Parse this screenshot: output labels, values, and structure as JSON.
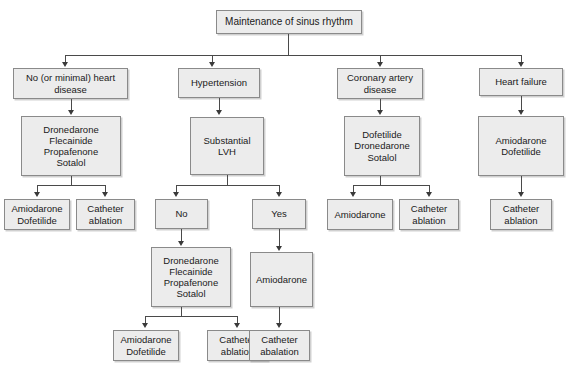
{
  "diagram": {
    "title": "Maintenance of sinus rhythm",
    "type": "flowchart",
    "nodes": {
      "root": "Maintenance of sinus rhythm",
      "branch_no_heart_disease": "No (or minimal) heart\ndisease",
      "branch_hypertension": "Hypertension",
      "branch_coronary": "Coronary artery\ndisease",
      "branch_heart_failure": "Heart failure",
      "nhd_drugs": "Dronedarone\nFlecainide\nPropafenone\nSotalol",
      "nhd_amio": "Amiodarone\nDofetilide",
      "nhd_ablation": "Catheter\nablation",
      "htn_lvh": "Substantial\nLVH",
      "htn_no": "No",
      "htn_yes": "Yes",
      "htn_no_drugs": "Dronedarone\nFlecainide\nPropafenone\nSotalol",
      "htn_no_amio": "Amiodarone\nDofetilide",
      "htn_no_ablation": "Catheter\nablation",
      "htn_yes_amio": "Amiodarone",
      "htn_yes_ablation": "Catheter\nabalation",
      "cad_drugs": "Dofetilide\nDronedarone\nSotalol",
      "cad_amio": "Amiodarone",
      "cad_ablation": "Catheter\nablation",
      "hf_drugs": "Amiodarone\nDofetilide",
      "hf_ablation": "Catheter\nablation"
    },
    "colors": {
      "node_fill": "#ececec",
      "node_border": "#8a8a8a",
      "connector": "#4a4a4a",
      "background": "#ffffff",
      "text": "#1a1a1a"
    }
  }
}
